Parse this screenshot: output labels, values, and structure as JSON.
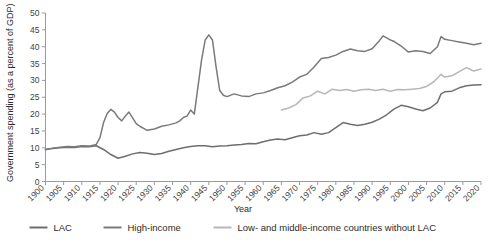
{
  "chart_data": {
    "type": "line",
    "title": "",
    "xlabel": "Year",
    "ylabel": "Government spending (as a percent of GDP)",
    "xlim": [
      1900,
      2020
    ],
    "ylim": [
      0,
      50
    ],
    "xticks": [
      1900,
      1905,
      1910,
      1915,
      1920,
      1925,
      1930,
      1935,
      1940,
      1945,
      1950,
      1955,
      1960,
      1965,
      1970,
      1975,
      1980,
      1985,
      1990,
      1995,
      2000,
      2005,
      2010,
      2015,
      2020
    ],
    "yticks": [
      0,
      5,
      10,
      15,
      20,
      25,
      30,
      35,
      40,
      45,
      50
    ],
    "grid": false,
    "legend_position": "bottom",
    "series": [
      {
        "name": "LAC",
        "color": "#6e6e6e",
        "x": [
          1900,
          1902,
          1904,
          1906,
          1908,
          1910,
          1912,
          1914,
          1916,
          1918,
          1920,
          1922,
          1924,
          1926,
          1928,
          1930,
          1932,
          1934,
          1936,
          1938,
          1940,
          1942,
          1944,
          1946,
          1948,
          1950,
          1952,
          1954,
          1956,
          1958,
          1960,
          1962,
          1964,
          1966,
          1968,
          1970,
          1972,
          1974,
          1976,
          1978,
          1980,
          1982,
          1984,
          1986,
          1988,
          1990,
          1992,
          1994,
          1996,
          1998,
          2000,
          2002,
          2004,
          2006,
          2008,
          2009,
          2010,
          2012,
          2014,
          2016,
          2018,
          2020
        ],
        "values": [
          9.6,
          9.8,
          10.0,
          10.2,
          10.1,
          10.4,
          10.3,
          10.6,
          9.5,
          8.0,
          6.9,
          7.5,
          8.2,
          8.6,
          8.4,
          8.0,
          8.3,
          9.0,
          9.5,
          10.0,
          10.4,
          10.6,
          10.6,
          10.3,
          10.5,
          10.6,
          10.8,
          11.0,
          11.3,
          11.2,
          11.8,
          12.3,
          12.6,
          12.4,
          13.0,
          13.6,
          13.8,
          14.5,
          14.0,
          14.5,
          16.0,
          17.5,
          17.0,
          16.6,
          17.0,
          17.6,
          18.5,
          19.8,
          21.5,
          22.6,
          22.2,
          21.5,
          21.0,
          21.8,
          23.5,
          26.0,
          26.6,
          26.8,
          27.8,
          28.4,
          28.6,
          28.7
        ]
      },
      {
        "name": "High-income",
        "color": "#7a7a7a",
        "x": [
          1900,
          1902,
          1904,
          1906,
          1908,
          1910,
          1912,
          1914,
          1915,
          1916,
          1917,
          1918,
          1919,
          1920,
          1921,
          1922,
          1923,
          1924,
          1925,
          1926,
          1928,
          1930,
          1932,
          1934,
          1936,
          1937,
          1938,
          1939,
          1940,
          1941,
          1942,
          1943,
          1944,
          1945,
          1946,
          1947,
          1948,
          1949,
          1950,
          1952,
          1954,
          1956,
          1958,
          1960,
          1962,
          1964,
          1966,
          1968,
          1970,
          1972,
          1974,
          1976,
          1978,
          1980,
          1982,
          1984,
          1986,
          1988,
          1990,
          1992,
          1993,
          1995,
          1996,
          1998,
          2000,
          2002,
          2004,
          2006,
          2008,
          2009,
          2010,
          2012,
          2014,
          2016,
          2018,
          2020
        ],
        "values": [
          9.4,
          9.9,
          10.2,
          10.4,
          10.3,
          10.6,
          10.5,
          11.0,
          13.0,
          17.5,
          20.2,
          21.4,
          20.6,
          19.0,
          18.0,
          19.4,
          20.6,
          18.9,
          17.2,
          16.4,
          15.2,
          15.6,
          16.4,
          16.8,
          17.4,
          18.0,
          19.0,
          19.4,
          21.2,
          20.0,
          28.0,
          36.0,
          42.0,
          43.5,
          42.0,
          34.0,
          27.0,
          25.6,
          25.2,
          26.0,
          25.4,
          25.2,
          26.0,
          26.3,
          27.0,
          27.8,
          28.4,
          29.5,
          31.0,
          31.8,
          34.0,
          36.5,
          36.8,
          37.5,
          38.6,
          39.3,
          38.8,
          38.6,
          39.4,
          41.8,
          43.2,
          42.0,
          41.6,
          40.2,
          38.4,
          38.8,
          38.6,
          38.0,
          40.0,
          43.0,
          42.2,
          41.8,
          41.4,
          41.0,
          40.6,
          41.0
        ]
      },
      {
        "name": "Low- and middle-income countries without LAC",
        "color": "#b7b7b7",
        "x": [
          1965,
          1967,
          1969,
          1971,
          1973,
          1975,
          1977,
          1979,
          1981,
          1983,
          1985,
          1987,
          1989,
          1991,
          1993,
          1995,
          1997,
          1999,
          2001,
          2003,
          2005,
          2007,
          2009,
          2010,
          2012,
          2014,
          2016,
          2018,
          2020
        ],
        "values": [
          21.2,
          21.8,
          22.8,
          24.8,
          25.4,
          26.8,
          26.0,
          27.4,
          27.0,
          27.3,
          26.8,
          27.2,
          27.4,
          27.0,
          27.4,
          26.8,
          27.3,
          27.2,
          27.4,
          27.6,
          28.2,
          29.6,
          31.8,
          31.0,
          31.4,
          32.6,
          33.8,
          32.8,
          33.4
        ]
      }
    ]
  },
  "legend": {
    "items": [
      {
        "label": "LAC",
        "color": "#6e6e6e"
      },
      {
        "label": "High-income",
        "color": "#7a7a7a"
      },
      {
        "label": "Low- and middle-income countries without LAC",
        "color": "#b7b7b7"
      }
    ]
  }
}
